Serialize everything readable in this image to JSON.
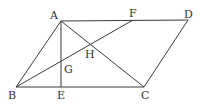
{
  "diagram": {
    "type": "geometry",
    "shape": "parallelogram",
    "points": {
      "A": {
        "x": 61,
        "y": 21
      },
      "D": {
        "x": 188,
        "y": 20
      },
      "F": {
        "x": 133,
        "y": 20
      },
      "B": {
        "x": 16,
        "y": 87
      },
      "E": {
        "x": 61,
        "y": 87
      },
      "C": {
        "x": 144,
        "y": 87
      },
      "H": {
        "x": 90,
        "y": 44
      },
      "G": {
        "x": 61,
        "y": 62
      }
    },
    "labels": {
      "A": "A",
      "F": "F",
      "D": "D",
      "H": "H",
      "G": "G",
      "B": "B",
      "E": "E",
      "C": "C"
    },
    "segments": [
      "AD",
      "DC",
      "CB",
      "BA",
      "AC",
      "BF",
      "AE"
    ],
    "colors": {
      "stroke": "#3a3a3a",
      "label": "#333333",
      "background": "#ffffff"
    }
  }
}
